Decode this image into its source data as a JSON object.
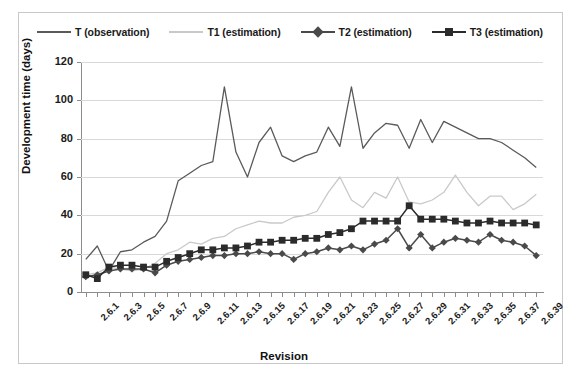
{
  "chart_data": {
    "type": "line",
    "title": "",
    "xlabel": "Revision",
    "ylabel": "Development time (days)",
    "ylim": [
      0,
      120
    ],
    "ytick_step": 20,
    "yticks": [
      0,
      20,
      40,
      60,
      80,
      100,
      120
    ],
    "grid": "horizontal",
    "legend_position": "top",
    "categories": [
      "2.6.1",
      "2.6.2",
      "2.6.3",
      "2.6.4",
      "2.6.5",
      "2.6.6",
      "2.6.7",
      "2.6.8",
      "2.6.9",
      "2.6.10",
      "2.6.11",
      "2.6.12",
      "2.6.13",
      "2.6.14",
      "2.6.15",
      "2.6.16",
      "2.6.17",
      "2.6.18",
      "2.6.19",
      "2.6.20",
      "2.6.21",
      "2.6.22",
      "2.6.23",
      "2.6.24",
      "2.6.25",
      "2.6.26",
      "2.6.27",
      "2.6.28",
      "2.6.29",
      "2.6.30",
      "2.6.31",
      "2.6.32",
      "2.6.33",
      "2.6.34",
      "2.6.35",
      "2.6.36",
      "2.6.37",
      "2.6.38",
      "2.6.39",
      "2.6.40"
    ],
    "xtick_labels": [
      "2.6.1",
      "2.6.3",
      "2.6.5",
      "2.6.7",
      "2.6.9",
      "2.6.11",
      "2.6.13",
      "2.6.15",
      "2.6.17",
      "2.6.19",
      "2.6.21",
      "2.6.23",
      "2.6.25",
      "2.6.27",
      "2.6.29",
      "2.6.31",
      "2.6.33",
      "2.6.35",
      "2.6.37",
      "2.6.39"
    ],
    "series": [
      {
        "name": "T (observation)",
        "color": "#5a5a5a",
        "marker": "none",
        "values": [
          17,
          24,
          11,
          21,
          22,
          26,
          29,
          37,
          58,
          62,
          66,
          68,
          107,
          73,
          60,
          78,
          86,
          71,
          68,
          71,
          73,
          86,
          76,
          107,
          75,
          83,
          88,
          87,
          75,
          90,
          78,
          89,
          86,
          83,
          80,
          80,
          78,
          74,
          70,
          65
        ]
      },
      {
        "name": "T1 (estimation)",
        "color": "#c9c9c9",
        "marker": "none",
        "values": [
          9,
          10,
          13,
          12,
          11,
          12,
          15,
          20,
          22,
          26,
          25,
          28,
          29,
          33,
          35,
          37,
          36,
          36,
          39,
          40,
          42,
          52,
          60,
          48,
          44,
          52,
          49,
          60,
          47,
          46,
          48,
          52,
          61,
          52,
          45,
          50,
          50,
          43,
          46,
          51
        ]
      },
      {
        "name": "T2 (estimation)",
        "color": "#4a4a4a",
        "marker": "diamond",
        "values": [
          8,
          9,
          11,
          12,
          12,
          12,
          10,
          14,
          16,
          17,
          18,
          19,
          19,
          20,
          20,
          21,
          20,
          20,
          17,
          20,
          21,
          23,
          22,
          24,
          22,
          25,
          27,
          33,
          23,
          30,
          23,
          26,
          28,
          27,
          26,
          30,
          27,
          26,
          24,
          19
        ]
      },
      {
        "name": "T3 (estimation)",
        "color": "#2b2b2b",
        "marker": "square",
        "values": [
          9,
          7,
          13,
          14,
          14,
          13,
          13,
          16,
          18,
          20,
          22,
          22,
          23,
          23,
          24,
          26,
          26,
          27,
          27,
          28,
          28,
          30,
          31,
          33,
          37,
          37,
          37,
          37,
          45,
          38,
          38,
          38,
          37,
          36,
          36,
          37,
          36,
          36,
          36,
          35
        ]
      }
    ]
  },
  "legend": {
    "items": [
      {
        "label": "T (observation)",
        "color": "#5a5a5a",
        "marker": "none"
      },
      {
        "label": "T1 (estimation)",
        "color": "#c9c9c9",
        "marker": "none"
      },
      {
        "label": "T2 (estimation)",
        "color": "#4a4a4a",
        "marker": "diamond"
      },
      {
        "label": "T3 (estimation)",
        "color": "#2b2b2b",
        "marker": "square"
      }
    ]
  },
  "axes": {
    "y_title": "Development time (days)",
    "x_title": "Revision"
  }
}
